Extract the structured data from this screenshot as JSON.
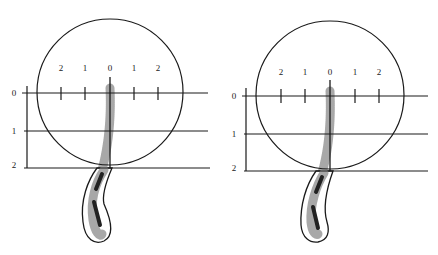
{
  "panels": [
    {
      "id": "left",
      "circle": {
        "cx": 110,
        "cy": 92,
        "r": 73
      },
      "origin_x": 110,
      "row_y": [
        93,
        131,
        168
      ],
      "axis_x": 27,
      "line_end_x": 208,
      "col_tick_x": [
        61,
        85,
        110,
        134,
        158
      ],
      "col_labels": [
        "2",
        "1",
        "0",
        "1",
        "2"
      ],
      "row_labels": [
        "0",
        "1",
        "2"
      ]
    },
    {
      "id": "right",
      "circle": {
        "cx": 330,
        "cy": 95,
        "r": 73
      },
      "origin_x": 330,
      "row_y": [
        96,
        134,
        171
      ],
      "axis_x": 246,
      "line_end_x": 428,
      "col_tick_x": [
        281,
        305,
        330,
        355,
        379
      ],
      "col_labels": [
        "2",
        "1",
        "0",
        "1",
        "2"
      ],
      "row_labels": [
        "0",
        "1",
        "2"
      ]
    }
  ],
  "colors": {
    "line": "#1a1a1a",
    "shadow": "#a8a8a8",
    "core": "#222222"
  }
}
